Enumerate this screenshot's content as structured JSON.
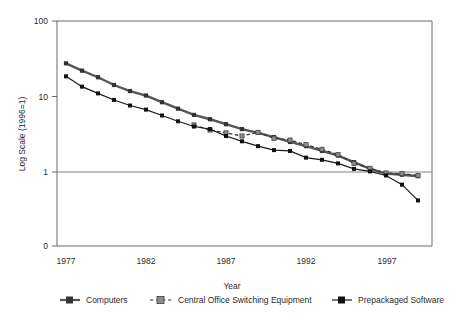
{
  "chart_data": {
    "type": "line",
    "title": "",
    "xlabel": "Year",
    "ylabel": "Log Scale (1996=1)",
    "scale": "log",
    "xlim": [
      1977,
      1999
    ],
    "ylim": [
      0.3,
      100
    ],
    "y_ticks": [
      "100",
      "10",
      "1",
      "0"
    ],
    "x_ticks": [
      "1977",
      "1982",
      "1987",
      "1992",
      "1997"
    ],
    "grid": "horizontal-at-1",
    "legend_position": "bottom",
    "colors": {
      "computers": "#555555",
      "central_office": "#7a7a7a",
      "prepackaged": "#1a1a1a",
      "axis": "#555555",
      "gridline": "#808080"
    },
    "x": [
      1977,
      1978,
      1979,
      1980,
      1981,
      1982,
      1983,
      1984,
      1985,
      1986,
      1987,
      1988,
      1989,
      1990,
      1991,
      1992,
      1993,
      1994,
      1995,
      1996,
      1997,
      1998,
      1999
    ],
    "series": [
      {
        "name": "Computers",
        "marker": "square",
        "line": "solid-thick",
        "values": [
          27.5,
          22.0,
          18.0,
          14.2,
          11.8,
          10.3,
          8.4,
          6.9,
          5.7,
          5.0,
          4.3,
          3.7,
          3.3,
          2.9,
          2.5,
          2.2,
          1.9,
          1.65,
          1.35,
          1.1,
          0.95,
          0.92,
          0.88
        ]
      },
      {
        "name": "Central Office Switching Equipment",
        "marker": "square-gray",
        "line": "dashed",
        "values": [
          null,
          null,
          null,
          null,
          null,
          null,
          null,
          null,
          4.2,
          3.6,
          3.3,
          3.0,
          3.35,
          2.8,
          2.65,
          2.3,
          2.0,
          1.7,
          1.3,
          1.12,
          0.97,
          0.95,
          0.9
        ]
      },
      {
        "name": "Prepackaged Software",
        "marker": "square-black",
        "line": "solid-thin",
        "values": [
          18.5,
          13.5,
          11.0,
          9.0,
          7.6,
          6.7,
          5.6,
          4.7,
          4.0,
          3.7,
          3.0,
          2.55,
          2.2,
          1.95,
          1.9,
          1.55,
          1.45,
          1.3,
          1.1,
          1.02,
          0.9,
          0.68,
          0.42
        ]
      }
    ]
  },
  "legend": {
    "items": [
      {
        "label": "Computers",
        "style": "solid-dark-square"
      },
      {
        "label": "Central Office Switching Equipment",
        "style": "dashed-gray-square"
      },
      {
        "label": "Prepackaged Software",
        "style": "solid-black-square"
      }
    ]
  }
}
